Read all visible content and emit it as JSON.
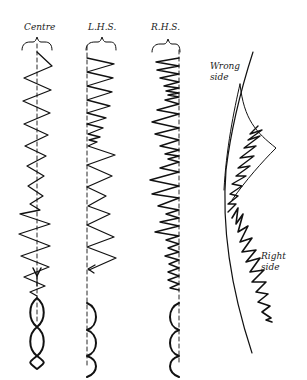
{
  "diagram": {
    "columns": [
      {
        "id": "centre",
        "label": "Centre"
      },
      {
        "id": "lhs",
        "label": "L.H.S."
      },
      {
        "id": "rhs",
        "label": "R.H.S."
      }
    ],
    "fabric": {
      "wrong_side_line1": "Wrong",
      "wrong_side_line2": "side",
      "right_side_line1": "Right",
      "right_side_line2": "side"
    },
    "colors": {
      "ink": "#111111",
      "background": "#ffffff"
    }
  }
}
